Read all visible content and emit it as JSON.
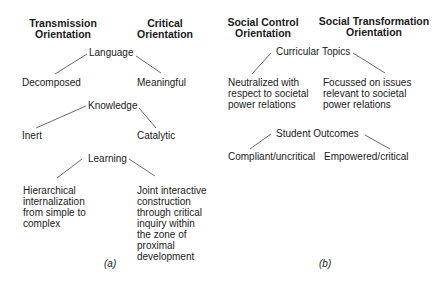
{
  "panel_a": {
    "headers": {
      "left": "Transmission\nOrientation",
      "right": "Critical\nOrientation"
    },
    "nodes": [
      {
        "label": "Language",
        "left": "Decomposed",
        "right": "Meaningful"
      },
      {
        "label": "Knowledge",
        "left": "Inert",
        "right": "Catalytic"
      },
      {
        "label": "Learning",
        "left": "Hierarchical internalization from simple to complex",
        "right": "Joint interactive construction through critical inquiry within the zone of proximal development"
      }
    ],
    "caption": "(a)"
  },
  "panel_b": {
    "headers": {
      "left": "Social Control\nOrientation",
      "right": "Social Transformation\nOrientation"
    },
    "nodes": [
      {
        "label": "Curricular Topics",
        "left": "Neutralized with respect to societal power relations",
        "right": "Focussed on issues relevant to societal power relations"
      },
      {
        "label": "Student Outcomes",
        "left": "Compliant/uncritical",
        "right": "Empowered/critical"
      }
    ],
    "caption": "(b)"
  }
}
